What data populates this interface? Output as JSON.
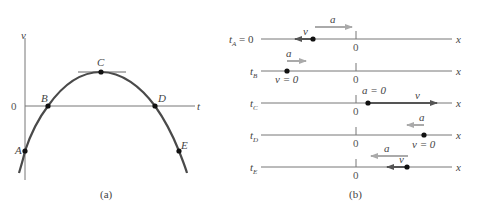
{
  "figure_a": {
    "caption": "(a)",
    "axis_labels": {
      "vertical": "v",
      "horizontal": "t",
      "origin": "0"
    },
    "points": [
      {
        "label": "A",
        "x": 25,
        "y": 151
      },
      {
        "label": "B",
        "x": 48,
        "y": 106
      },
      {
        "label": "C",
        "x": 101,
        "y": 72
      },
      {
        "label": "D",
        "x": 155,
        "y": 106
      },
      {
        "label": "E",
        "x": 179,
        "y": 151
      }
    ]
  },
  "figure_b": {
    "caption": "(b)",
    "axis_label": "x",
    "origin_label": "0",
    "rows": [
      {
        "time": "t",
        "sub": "A",
        "suffix": " = 0",
        "v_label": "v",
        "a_label": "a",
        "note": ""
      },
      {
        "time": "t",
        "sub": "B",
        "suffix": "",
        "v_label": "v = 0",
        "a_label": "a",
        "note": ""
      },
      {
        "time": "t",
        "sub": "C",
        "suffix": "",
        "v_label": "v",
        "a_label": "a = 0",
        "note": ""
      },
      {
        "time": "t",
        "sub": "D",
        "suffix": "",
        "v_label": "v = 0",
        "a_label": "a",
        "note": ""
      },
      {
        "time": "t",
        "sub": "E",
        "suffix": "",
        "v_label": "v",
        "a_label": "a",
        "note": ""
      }
    ]
  },
  "colors": {
    "curve": "#4a4a4a",
    "axis": "#777777",
    "velocity_arrow": "#555555",
    "accel_arrow": "#a8a8a8",
    "dot": "#111111"
  }
}
